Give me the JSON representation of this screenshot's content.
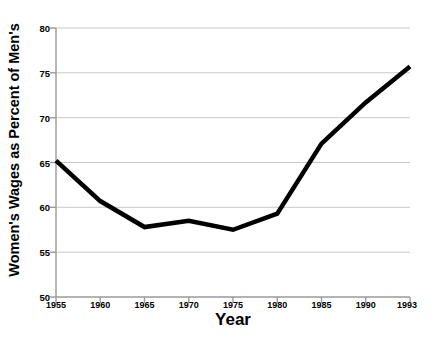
{
  "chart_data": {
    "type": "line",
    "title": "",
    "xlabel": "Year",
    "ylabel": "Women's Wages as Percent of Men's",
    "categories": [
      "1955",
      "1960",
      "1965",
      "1970",
      "1975",
      "1980",
      "1985",
      "1990",
      "1993"
    ],
    "x": [
      1955,
      1960,
      1965,
      1970,
      1975,
      1980,
      1985,
      1990,
      1993
    ],
    "values": [
      65.2,
      60.7,
      57.8,
      58.5,
      57.5,
      59.3,
      67.1,
      71.7,
      75.7
    ],
    "series": [
      {
        "name": "Women's Wages as Percent of Men's",
        "values": [
          65.2,
          60.7,
          57.8,
          58.5,
          57.5,
          59.3,
          67.1,
          71.7,
          75.7
        ],
        "color": "#000000",
        "line_width": 4.5
      }
    ],
    "ylim": [
      50,
      80
    ],
    "yticks": [
      50,
      55,
      60,
      65,
      70,
      75,
      80
    ],
    "ytick_labels": [
      "50",
      "55",
      "60",
      "65",
      "70",
      "75",
      "80"
    ],
    "xtick_labels": [
      "1955",
      "1960",
      "1965",
      "1970",
      "1975",
      "1980",
      "1985",
      "1990",
      "1993"
    ],
    "grid": {
      "horizontal": true,
      "vertical": false,
      "color": "#c8c8c8"
    },
    "legend": {
      "visible": false,
      "position": "none"
    },
    "axis_color": "#a0a0a0",
    "background": "#ffffff"
  }
}
